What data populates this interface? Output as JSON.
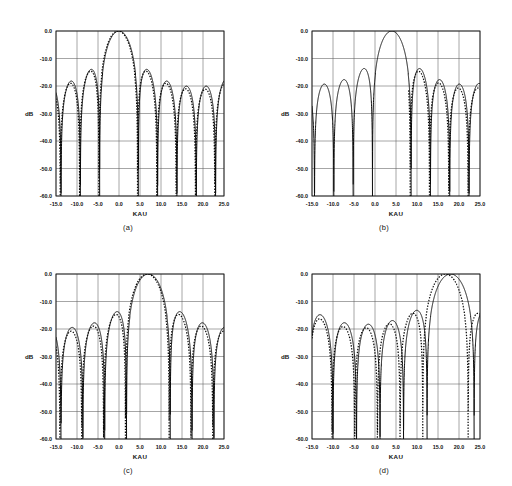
{
  "figure": {
    "title": "",
    "panels": [
      {
        "id": "a",
        "caption": "(a)",
        "xlabel": "KAU",
        "ylabel": "dB",
        "xticks": [
          "-15.0",
          "-10.0",
          "-5.0",
          "0.0",
          "5.0",
          "10.0",
          "15.0",
          "20.0",
          "25.0"
        ],
        "yticks": [
          "0.0",
          "-10.0",
          "-20.0",
          "-30.0",
          "-40.0",
          "-50.0",
          "-60.0"
        ],
        "xlim": [
          -15.0,
          25.0
        ],
        "ylim": [
          -60.0,
          0.0
        ],
        "beam_center": 0.0,
        "mainlobe_peak_db": 0.0,
        "first_sidelobe_db": -25.0,
        "series": [
          {
            "name": "solid",
            "style": "solid",
            "center": 0.0,
            "lobe_width": 4.6,
            "taper": 0.085,
            "floor": -60.0
          },
          {
            "name": "dotted",
            "style": "dotted",
            "center": 0.0,
            "lobe_width": 4.6,
            "taper": 0.1,
            "floor": -60.0,
            "phase_shift": 0.18,
            "level_shift": 1.2
          }
        ]
      },
      {
        "id": "b",
        "caption": "(b)",
        "xlabel": "KAU",
        "ylabel": "dB",
        "xticks": [
          "-15.0",
          "-10.0",
          "-5.0",
          "0.0",
          "5.0",
          "10.0",
          "15.0",
          "20.0",
          "25.0"
        ],
        "yticks": [
          "0.0",
          "-10.0",
          "-20.0",
          "-30.0",
          "-40.0",
          "-50.0",
          "-60.0"
        ],
        "xlim": [
          -15.0,
          25.0
        ],
        "ylim": [
          -60.0,
          0.0
        ],
        "beam_center": 4.0,
        "mainlobe_peak_db": 0.0,
        "first_sidelobe_db": -20.5,
        "series": [
          {
            "name": "solid",
            "style": "solid",
            "center": 4.0,
            "lobe_width": 4.6,
            "taper": 0.065,
            "floor": -60.0
          },
          {
            "name": "dotted",
            "style": "dotted",
            "center": 4.0,
            "lobe_width": 4.6,
            "taper": 0.085,
            "floor": -60.0,
            "phase_shift": 0.22,
            "level_shift": 2.0,
            "start_x": 8.0
          }
        ]
      },
      {
        "id": "c",
        "caption": "(c)",
        "xlabel": "KAU",
        "ylabel": "dB",
        "xticks": [
          "-15.0",
          "-10.0",
          "-5.0",
          "0.0",
          "5.0",
          "10.0",
          "15.0",
          "20.0",
          "25.0"
        ],
        "yticks": [
          "0.0",
          "-10.0",
          "-20.0",
          "-30.0",
          "-40.0",
          "-50.0",
          "-60.0"
        ],
        "xlim": [
          -15.0,
          25.0
        ],
        "ylim": [
          -60.0,
          0.0
        ],
        "beam_center": 7.0,
        "mainlobe_peak_db": 0.0,
        "first_sidelobe_db": -18.5,
        "series": [
          {
            "name": "solid",
            "style": "solid",
            "center": 7.0,
            "lobe_width": 5.2,
            "taper": 0.06,
            "floor": -60.0
          },
          {
            "name": "dotted",
            "style": "dotted",
            "center": 7.0,
            "lobe_width": 5.2,
            "taper": 0.075,
            "floor": -60.0,
            "phase_shift": 0.26,
            "level_shift": 2.2
          }
        ]
      },
      {
        "id": "d",
        "caption": "(d)",
        "xlabel": "KAU",
        "ylabel": "dB",
        "xticks": [
          "-15.0",
          "-10.0",
          "-5.0",
          "0.0",
          "5.0",
          "10.0",
          "15.0",
          "20.0",
          "25.0"
        ],
        "yticks": [
          "0.0",
          "-10.0",
          "-20.0",
          "-30.0",
          "-40.0",
          "-50.0",
          "-60.0"
        ],
        "xlim": [
          -15.0,
          25.0
        ],
        "ylim": [
          -60.0,
          0.0
        ],
        "beam_center": 18.0,
        "mainlobe_peak_db": 0.0,
        "first_sidelobe_db": -13.5,
        "series": [
          {
            "name": "solid",
            "style": "solid",
            "center": 18.0,
            "lobe_width": 5.6,
            "taper": 0.03,
            "floor": -60.0
          },
          {
            "name": "dotted",
            "style": "dotted",
            "center": 17.2,
            "lobe_width": 5.4,
            "taper": 0.04,
            "floor": -60.0,
            "phase_shift": 0.42,
            "level_shift": 2.6
          }
        ]
      }
    ]
  },
  "chart_data": {
    "type": "line",
    "title": "",
    "panel_count": 4,
    "shared": {
      "xlabel": "KAU",
      "ylabel": "dB",
      "xlim": [
        -15.0,
        25.0
      ],
      "ylim": [
        -60.0,
        0.0
      ],
      "xticks": [
        -15.0,
        -10.0,
        -5.0,
        0.0,
        5.0,
        10.0,
        15.0,
        20.0,
        25.0
      ],
      "yticks": [
        0.0,
        -10.0,
        -20.0,
        -30.0,
        -40.0,
        -50.0,
        -60.0
      ],
      "grid": true,
      "legend": "none",
      "series_names": [
        "solid",
        "dotted"
      ]
    },
    "panels": [
      {
        "label": "(a)",
        "mainlobe_x": 0.0,
        "mainlobe_y": 0.0,
        "sidelobe_peaks": {
          "x": [
            -13.2,
            -10.8,
            -8.3,
            -5.8,
            -3.4,
            3.4,
            5.8,
            8.3,
            10.8,
            13.2,
            15.8,
            18.3,
            20.8,
            23.3
          ],
          "solid_y": [
            -43.0,
            -36.5,
            -34.5,
            -32.0,
            -25.5,
            -26.5,
            -32.5,
            -33.0,
            -36.0,
            -37.5,
            -39.5,
            -42.5,
            -44.5,
            -45.5
          ],
          "dotted_y": [
            -42.0,
            -36.0,
            -34.0,
            -31.5,
            -24.5,
            -25.0,
            -32.0,
            -33.5,
            -37.0,
            -38.5,
            -41.0,
            -43.5,
            -45.5,
            -46.0
          ]
        },
        "null_depth_db": -60.0
      },
      {
        "label": "(b)",
        "mainlobe_x": 4.0,
        "mainlobe_y": 0.0,
        "sidelobe_peaks": {
          "x": [
            -13.5,
            -11.0,
            -8.5,
            -5.5,
            -2.2,
            9.5,
            11.8,
            14.3,
            16.8,
            19.3,
            21.8,
            24.2
          ],
          "solid_y": [
            -40.0,
            -36.0,
            -33.0,
            -29.5,
            -20.5,
            -29.5,
            -33.5,
            -35.5,
            -39.0,
            -41.0,
            -43.5,
            -44.5
          ],
          "dotted_y": [
            -40.0,
            -36.0,
            -33.0,
            -29.5,
            -20.5,
            -29.0,
            -34.5,
            -37.0,
            -40.0,
            -42.5,
            -44.0,
            -45.5
          ]
        },
        "null_depth_db": -60.0
      },
      {
        "label": "(c)",
        "mainlobe_x": 7.0,
        "mainlobe_y": 0.0,
        "sidelobe_peaks": {
          "x": [
            -14.0,
            -12.0,
            -9.5,
            -7.0,
            -4.6,
            -2.2,
            1.5,
            12.8,
            15.0,
            17.8,
            20.5,
            23.5
          ],
          "solid_y": [
            -40.5,
            -38.5,
            -35.5,
            -31.5,
            -27.0,
            -26.0,
            -18.5,
            -32.0,
            -32.0,
            -36.0,
            -39.5,
            -41.0
          ],
          "dotted_y": [
            -38.5,
            -36.5,
            -34.0,
            -30.5,
            -26.0,
            -25.0,
            -19.0,
            -33.0,
            -34.5,
            -37.0,
            -40.0,
            -41.5
          ]
        },
        "null_depth_db": -60.0
      },
      {
        "label": "(d)",
        "mainlobe_x": 18.0,
        "mainlobe_y": 0.0,
        "sidelobe_peaks": {
          "x": [
            -14.0,
            -12.0,
            -10.2,
            -8.2,
            -6.2,
            -4.2,
            -2.0,
            0.5,
            3.2,
            5.8,
            8.5,
            12.2
          ],
          "solid_y": [
            -43.0,
            -42.0,
            -40.0,
            -39.0,
            -37.5,
            -36.0,
            -34.5,
            -31.0,
            -29.0,
            -23.5,
            -21.0,
            -13.5
          ],
          "dotted_y": [
            -44.0,
            -43.5,
            -41.5,
            -40.0,
            -38.5,
            -37.0,
            -35.0,
            -32.5,
            -30.0,
            -25.0,
            -22.5,
            -15.5
          ]
        },
        "null_depth_db": -60.0
      }
    ]
  }
}
